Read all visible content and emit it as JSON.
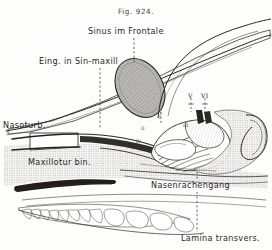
{
  "figure": {
    "caption": "Fig. 924.",
    "background_color": "#fdfdfc",
    "ink_color": "#2a2724",
    "width": 272,
    "height": 250
  },
  "labels": {
    "sinus_frontale": "Sinus im Frontale",
    "eing_sin_maxill": "Eing. in Sin-maxill",
    "nasoturb": "Nasoturb.",
    "maxilloturbin": "Maxillotur bin.",
    "nasenrachengang": "Nasenrachengang",
    "lamina_transvers": "Lamina transvers."
  },
  "markers": {
    "ethmoturbinal_v": "V",
    "ethmoturbinal_vi": "VI",
    "turbinal_i": "I",
    "turbinal_ii": "II",
    "turbinal_iii": "III",
    "turbinal_iv": "IV"
  },
  "leader_lines": {
    "style": "dashed",
    "color": "#3d3934"
  }
}
